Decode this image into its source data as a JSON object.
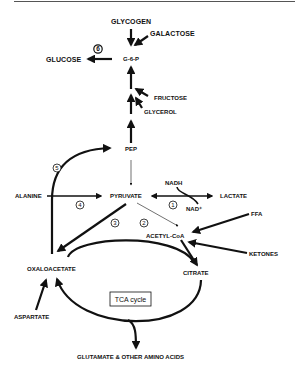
{
  "diagram": {
    "colors": {
      "ink": "#111111",
      "background": "#ffffff"
    },
    "nodes": {
      "glycogen": "GLYCOGEN",
      "galactose": "GALACTOSE",
      "g6p": "G-6-P",
      "glucose": "GLUCOSE",
      "fructose": "FRUCTOSE",
      "glycerol": "GLYCEROL",
      "pep": "PEP",
      "nadh": "NADH",
      "alanine": "ALANINE",
      "pyruvate": "PYRUVATE",
      "lactate": "LACTATE",
      "nad": "NAD⁺",
      "ffa": "FFA",
      "acetyl_coa": "ACETYL-CoA",
      "ketones": "KETONES",
      "oxaloacetate": "OXALOACETATE",
      "citrate": "CITRATE",
      "tca_cycle": "TCA cycle",
      "aspartate": "ASPARTATE",
      "glutamate": "GLUTAMATE & OTHER AMINO ACIDS"
    },
    "step_numbers": {
      "s1": "1",
      "s2": "2",
      "s3": "3",
      "s4": "4",
      "s5": "5",
      "s6": "6"
    }
  }
}
